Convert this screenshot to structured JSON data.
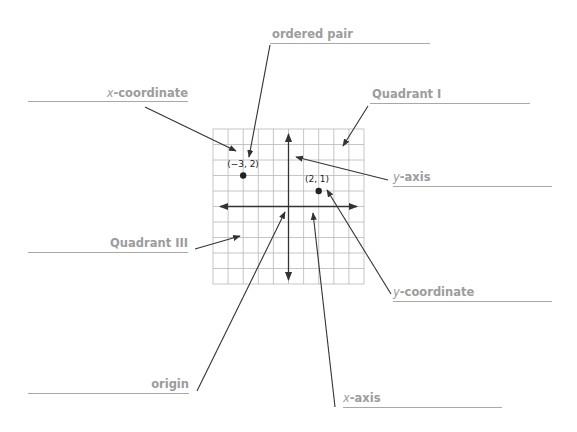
{
  "diagram": {
    "colors": {
      "label_text": "#9c9c9c",
      "label_line": "#a8a8a8",
      "arrow": "#333333",
      "grid": "#b5b5b5",
      "axis": "#333333"
    },
    "grid": {
      "columns": 10,
      "rows": 10,
      "x_range": [
        -5,
        5
      ],
      "y_range": [
        -5,
        5
      ]
    },
    "points": [
      {
        "label": "(−3, 2)",
        "x": -3,
        "y": 2
      },
      {
        "label": "(2, 1)",
        "x": 2,
        "y": 1
      }
    ],
    "labels": {
      "ordered_pair": {
        "text": "ordered pair"
      },
      "x_coordinate": {
        "prefix": "x",
        "text": "-coordinate"
      },
      "quadrant_1": {
        "text": "Quadrant I"
      },
      "y_axis": {
        "prefix": "y",
        "text": "-axis"
      },
      "quadrant_3": {
        "text": "Quadrant III"
      },
      "y_coordinate": {
        "prefix": "y",
        "text": "-coordinate"
      },
      "origin": {
        "text": "origin"
      },
      "x_axis": {
        "prefix": "x",
        "text": "-axis"
      }
    }
  }
}
